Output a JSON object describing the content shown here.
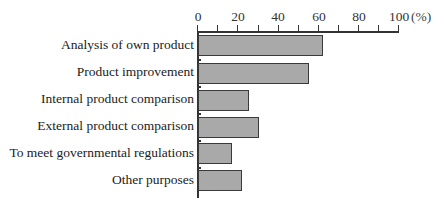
{
  "chart_data": {
    "type": "bar",
    "orientation": "horizontal",
    "title": "",
    "xlabel": "(%)",
    "ylabel": "",
    "xlim": [
      0,
      100
    ],
    "x_ticks": [
      "0",
      "20",
      "40",
      "60",
      "80",
      "100"
    ],
    "x_unit": "(%)",
    "grid": false,
    "legend": null,
    "categories": [
      "Analysis of own product",
      "Product improvement",
      "Internal product comparison",
      "External product comparison",
      "To meet governmental regulations",
      "Other purposes"
    ],
    "values": [
      62,
      55,
      25,
      30,
      17,
      22
    ],
    "bar_color": "#a9a9a9",
    "bar_edge_color": "#3a3a3a"
  }
}
